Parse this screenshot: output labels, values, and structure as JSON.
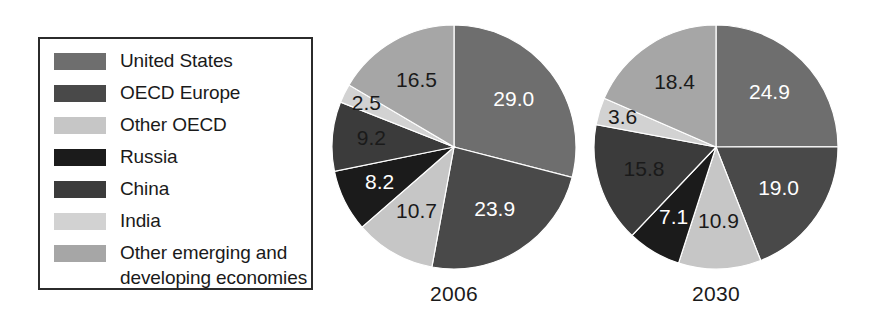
{
  "legend": {
    "items": [
      {
        "label": "United States",
        "color": "#6e6e6e"
      },
      {
        "label": "OECD Europe",
        "color": "#494949"
      },
      {
        "label": "Other OECD",
        "color": "#c6c6c6"
      },
      {
        "label": "Russia",
        "color": "#1b1b1b"
      },
      {
        "label": "China",
        "color": "#3b3b3b"
      },
      {
        "label": "India",
        "color": "#d2d2d2"
      },
      {
        "label": "Other emerging and\ndeveloping economies",
        "color": "#a6a6a6"
      }
    ]
  },
  "charts": [
    {
      "caption": "2006"
    },
    {
      "caption": "2030"
    }
  ],
  "chart_data": [
    {
      "type": "pie",
      "title": "2006",
      "categories": [
        "United States",
        "OECD Europe",
        "Other OECD",
        "Russia",
        "China",
        "India",
        "Other emerging and developing economies"
      ],
      "values": [
        29.0,
        23.9,
        10.7,
        8.2,
        9.2,
        2.5,
        16.5
      ],
      "data_labels": [
        "29.0",
        "23.9",
        "10.7",
        "8.2",
        "9.2",
        "2.5",
        "16.5"
      ],
      "label_colors": [
        "#ffffff",
        "#ffffff",
        "#1a1a1a",
        "#ffffff",
        "#1a1a1a",
        "#1a1a1a",
        "#1a1a1a"
      ],
      "colors": [
        "#6e6e6e",
        "#494949",
        "#c6c6c6",
        "#1b1b1b",
        "#3b3b3b",
        "#d2d2d2",
        "#a6a6a6"
      ],
      "start_angle": 0,
      "direction": "clockwise",
      "units": "percent",
      "legend_position": "left"
    },
    {
      "type": "pie",
      "title": "2030",
      "categories": [
        "United States",
        "OECD Europe",
        "Other OECD",
        "Russia",
        "China",
        "India",
        "Other emerging and developing economies"
      ],
      "values": [
        24.9,
        19.0,
        10.9,
        7.1,
        15.8,
        3.6,
        18.4
      ],
      "data_labels": [
        "24.9",
        "19.0",
        "10.9",
        "7.1",
        "15.8",
        "3.6",
        "18.4"
      ],
      "label_colors": [
        "#ffffff",
        "#ffffff",
        "#1a1a1a",
        "#ffffff",
        "#1a1a1a",
        "#1a1a1a",
        "#1a1a1a"
      ],
      "colors": [
        "#6e6e6e",
        "#494949",
        "#c6c6c6",
        "#1b1b1b",
        "#3b3b3b",
        "#d2d2d2",
        "#a6a6a6"
      ],
      "start_angle": 0,
      "direction": "clockwise",
      "units": "percent",
      "legend_position": "left"
    }
  ]
}
